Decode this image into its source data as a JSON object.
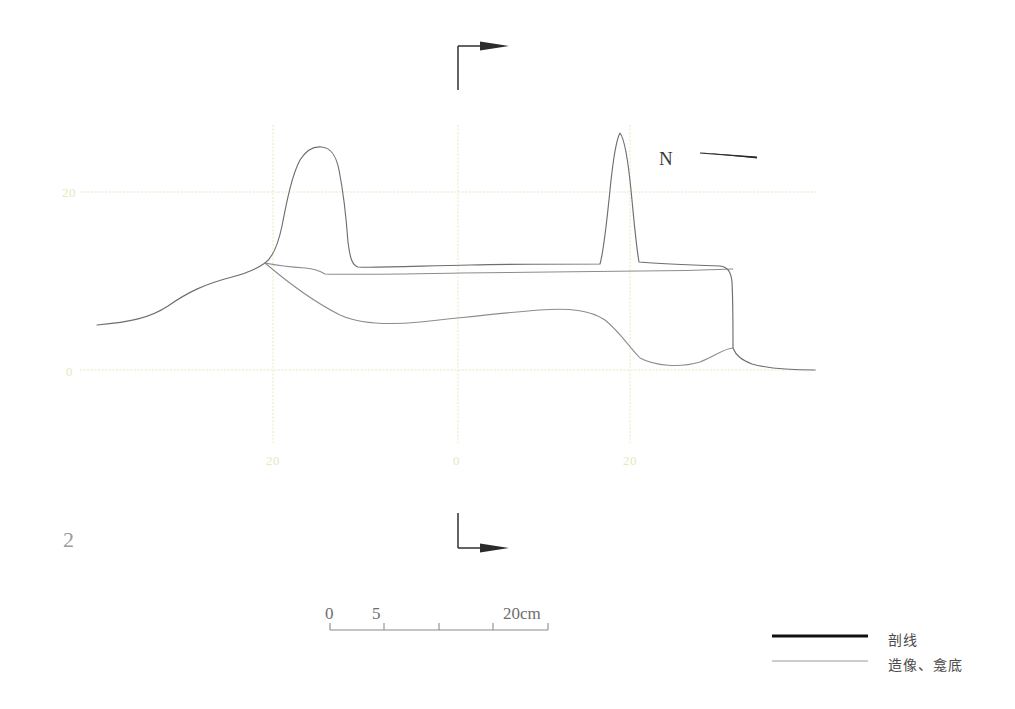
{
  "figure": {
    "number": "2",
    "north_label": "N",
    "orientation": "north-arrow-points-left"
  },
  "axes": {
    "vertical_tick_labels": [
      {
        "text": "20",
        "x": 62,
        "y": 185
      },
      {
        "text": "0",
        "x": 66,
        "y": 364
      }
    ],
    "horizontal_tick_labels": [
      {
        "text": "20",
        "x": 266,
        "y": 453
      },
      {
        "text": "0",
        "x": 453,
        "y": 453
      },
      {
        "text": "20",
        "x": 623,
        "y": 453
      }
    ],
    "grid_color": "#e8e7bb",
    "horizontal_gridlines_y": [
      192,
      370
    ],
    "vertical_gridlines_x": [
      273,
      458,
      630
    ],
    "grid_x_start": 80,
    "grid_x_end": 816,
    "grid_y_start": 125,
    "grid_y_end": 443
  },
  "scale_bar": {
    "label_zero": "0",
    "label_five": "5",
    "label_max": "20cm",
    "ticks": [
      0,
      5,
      10,
      15,
      20
    ],
    "units": "cm",
    "x_start": 330,
    "x_end": 548,
    "y": 630,
    "color": "#8a8a8a"
  },
  "legend": {
    "items": [
      {
        "label": "剖线",
        "style": "thick-black-line",
        "color": "#111111",
        "width": 3
      },
      {
        "label": "造像、龛底",
        "style": "thin-gray-line",
        "color": "#9a9a9a",
        "width": 1
      }
    ],
    "swatch_x_start": 772,
    "swatch_x_end": 868
  },
  "section_markers": [
    {
      "name": "top-section-marker",
      "x": 458,
      "y": 45,
      "arrow_direction": "right",
      "corner": "top-left"
    },
    {
      "name": "bottom-section-marker",
      "x": 458,
      "y": 548,
      "arrow_direction": "right",
      "corner": "bottom-left"
    }
  ],
  "chart_data": {
    "type": "line",
    "title": "",
    "xlabel": "",
    "ylabel": "",
    "xlim": [
      80,
      816
    ],
    "ylim": [
      0,
      20
    ],
    "grid": true,
    "legend_position": "bottom-right",
    "series": [
      {
        "name": "剖线",
        "role": "outer-profile",
        "color": "#6e6e72",
        "path": "M 97,325 C 130,322 150,318 168,306 C 188,292 205,284 232,277 C 248,273 258,268 265,263 C 272,258 278,245 282,226 C 287,200 292,175 300,160 C 307,149 315,146 322,147 C 331,148 336,155 339,170 C 343,190 346,215 348,242 C 350,258 352,265 358,267 C 372,268 420,266 470,265 C 520,264 570,264 600,264 C 604,250 607,220 610,190 C 613,160 616,140 620,133 C 624,138 628,160 631,190 C 634,220 636,245 639,262 C 650,263 690,265 720,266 C 728,267 731,272 732,282 C 733,300 733,330 733,348 C 736,356 742,360 752,364 C 770,369 790,370 815,370"
      },
      {
        "name": "造像、龛底",
        "role": "inner-statue-line",
        "color": "#8c8c90",
        "path": "M 265,263 C 275,265 290,267 305,268 C 315,269 320,271 325,274 C 345,275 400,274 460,273 C 520,272 580,272 640,271 C 680,271 710,270 733,269"
      },
      {
        "name": "造像、龛底",
        "role": "niche-base-line",
        "color": "#8c8c90",
        "path": "M 265,263 C 285,280 310,300 340,315 C 360,324 390,325 420,322 C 460,318 500,313 540,310 C 570,308 590,310 605,320 C 620,332 630,348 640,358 C 655,366 680,368 700,362 C 715,356 725,348 733,348"
      }
    ]
  }
}
